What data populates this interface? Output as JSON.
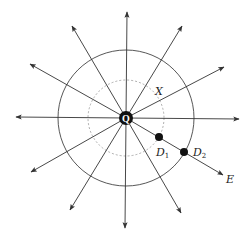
{
  "diagram": {
    "center": {
      "x": 126,
      "y": 118
    },
    "colors": {
      "line": "#333333",
      "circle": "#444444",
      "dashed": "#999999",
      "point": "#111111",
      "background": "#ffffff"
    },
    "charge": {
      "label": "Q",
      "radius": 7
    },
    "outer_circle": {
      "radius": 68
    },
    "inner_dashed_circle": {
      "radius": 38
    },
    "field_lines": [
      {
        "name": "up",
        "tip": [
          127,
          12
        ]
      },
      {
        "name": "down",
        "tip": [
          125,
          228
        ]
      },
      {
        "name": "left",
        "tip": [
          16,
          117
        ]
      },
      {
        "name": "right",
        "tip": [
          239,
          119
        ]
      },
      {
        "name": "upper-left-steep",
        "tip": [
          72,
          26
        ]
      },
      {
        "name": "upper-left-shallow",
        "tip": [
          30,
          64
        ]
      },
      {
        "name": "upper-right-steep",
        "tip": [
          182,
          26
        ]
      },
      {
        "name": "upper-right-shallow",
        "tip": [
          224,
          67
        ]
      },
      {
        "name": "lower-left-shallow",
        "tip": [
          31,
          172
        ]
      },
      {
        "name": "lower-left-steep",
        "tip": [
          70,
          210
        ]
      },
      {
        "name": "lower-right-steep",
        "tip": [
          181,
          213
        ]
      },
      {
        "name": "lower-right-shallow",
        "tip": [
          223,
          175
        ]
      }
    ],
    "points": [
      {
        "label": "D",
        "subscript": "1",
        "x": 159,
        "y": 137,
        "label_x": 156,
        "label_y": 156
      },
      {
        "label": "D",
        "subscript": "2",
        "x": 184,
        "y": 152,
        "label_x": 193,
        "label_y": 156
      }
    ],
    "labels": {
      "X": {
        "text": "X",
        "x": 155,
        "y": 95
      },
      "E": {
        "text": "E",
        "x": 226,
        "y": 183
      }
    }
  }
}
